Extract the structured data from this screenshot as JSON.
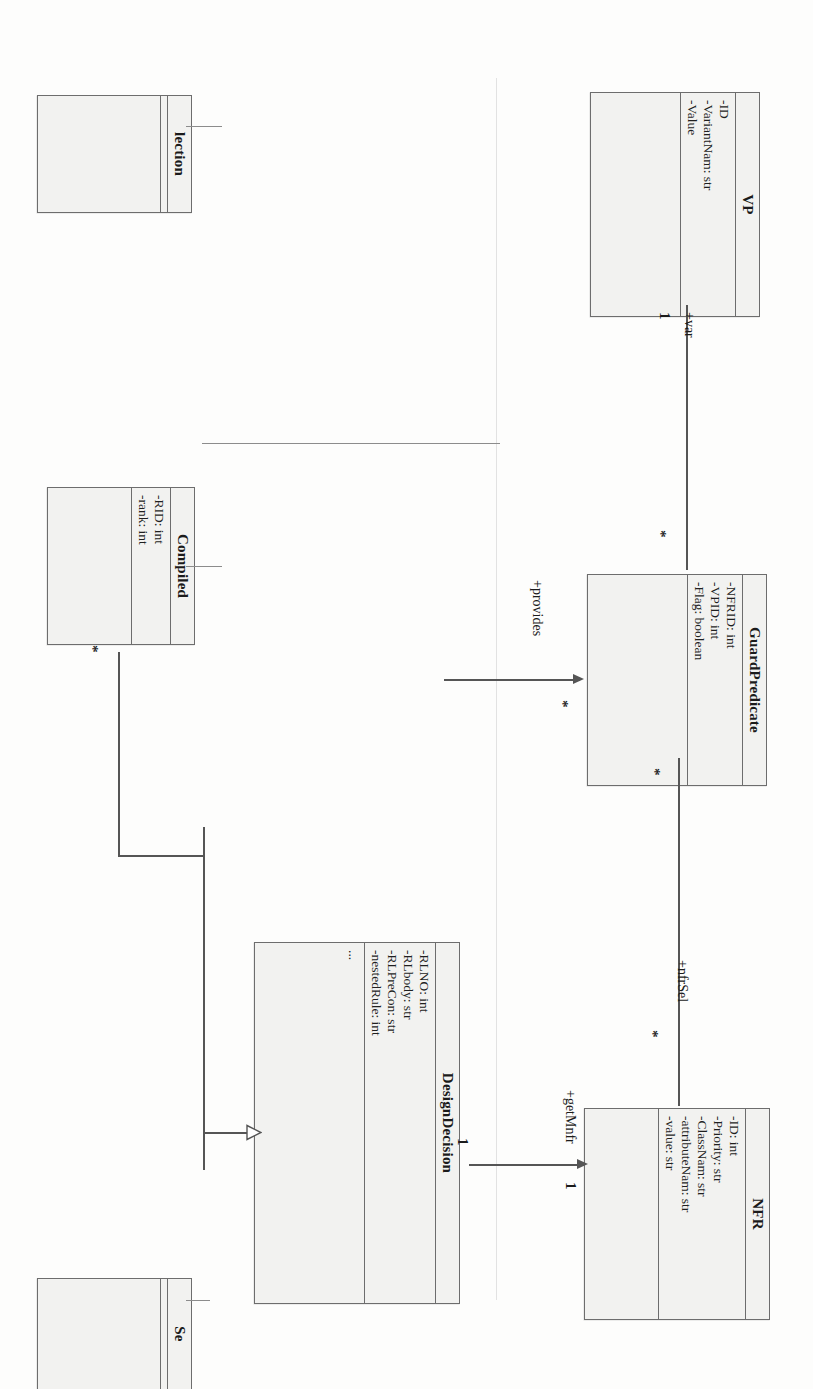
{
  "diagram": {
    "kind": "uml-class-diagram",
    "orientation_note": "rotated-90-clockwise",
    "background_color": "#ffffff",
    "box_fill_color": "#f2f2f0",
    "line_color": "#555555",
    "text_color": "#1b1b1b"
  },
  "classes": {
    "vp": {
      "name": "VP",
      "attributes": [
        "-ID",
        "-VariantNam: str",
        "-Value"
      ],
      "operations": []
    },
    "guard_predicate": {
      "name": "GuardPredicate",
      "attributes": [
        "-NFRID: int",
        "-VPID: int",
        "-Flag: boolean"
      ],
      "operations": []
    },
    "nfr": {
      "name": "NFR",
      "attributes": [
        "-ID: int",
        "-Priority: str",
        "-ClassNam: str",
        "-attributeNam: str",
        "-value: str"
      ],
      "operations": []
    },
    "design_decision": {
      "name": "DesignDecision",
      "attributes": [
        "-RLNO: int",
        "-RLbody: str",
        "-RLPreCon: str",
        "-nestedRule: int"
      ],
      "operations": [
        "..."
      ]
    },
    "compiled": {
      "name": "Compiled",
      "attributes": [
        "-RID: int",
        "-rank: int"
      ],
      "operations": []
    },
    "partial_top_left": {
      "name": "lection",
      "attributes": [],
      "operations": []
    },
    "partial_bottom_left": {
      "name": "Se",
      "attributes": [],
      "operations": []
    }
  },
  "associations": [
    {
      "id": "vp-guardpredicate",
      "role": "+var",
      "source_multiplicity": "1",
      "target_multiplicity": "*"
    },
    {
      "id": "designdecision-guardpredicate",
      "role": "+provides",
      "target_multiplicity": "*"
    },
    {
      "id": "guardpredicate-nfr",
      "role": "+nfrSel",
      "target_multiplicity": "*"
    },
    {
      "id": "designdecision-nfr",
      "role": "+getMnfr",
      "source_multiplicity": "1",
      "target_multiplicity": "1"
    },
    {
      "id": "compiled-designdecision",
      "role": "",
      "source_multiplicity": "*",
      "kind": "generalization"
    }
  ],
  "labels": {
    "var": "+var",
    "provides": "+provides",
    "nfr_sel": "+nfrSel",
    "get_mnfr": "+getMnfr",
    "mult_one_vp": "1",
    "mult_star_guard_top": "*",
    "mult_star_guard_provides": "*",
    "mult_star_guard_bottom": "*",
    "mult_star_nfr_sel": "*",
    "mult_one_nfr": "1",
    "mult_one_dd": "1",
    "mult_star_compiled": "*"
  }
}
